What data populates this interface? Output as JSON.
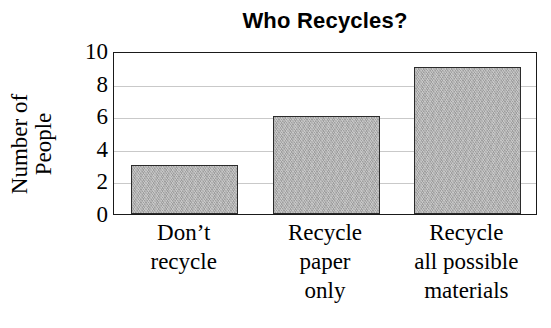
{
  "chart_data": {
    "type": "bar",
    "title": "Who Recycles?",
    "xlabel": "",
    "ylabel": "Number of People",
    "ylabel_lines": [
      "Number of",
      "People"
    ],
    "categories": [
      "Don’t recycle",
      "Recycle paper only",
      "Recycle all possible materials"
    ],
    "category_lines": [
      [
        "Don’t",
        "recycle"
      ],
      [
        "Recycle",
        "paper",
        "only"
      ],
      [
        "Recycle",
        "all possible",
        "materials"
      ]
    ],
    "values": [
      3,
      6,
      9
    ],
    "ylim": [
      0,
      10
    ],
    "ytick_labels": [
      "0",
      "2",
      "4",
      "6",
      "8",
      "10"
    ],
    "ytick_values": [
      0,
      2,
      4,
      6,
      8,
      10
    ],
    "gridline_values": [
      2,
      4,
      6,
      8
    ],
    "grid": true,
    "legend": "none",
    "bar_fill_color": "#adadad",
    "bar_border_color": "#2b2b2b",
    "gridline_color": "#c9c9c9",
    "axis_color": "#1a1a1a",
    "background_color": "#ffffff"
  }
}
